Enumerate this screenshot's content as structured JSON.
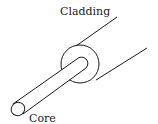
{
  "diagram": {
    "labels": {
      "cladding": "Cladding",
      "core": "Core"
    },
    "colors": {
      "stroke": "#1a1a1a",
      "text": "#222222",
      "background": "#ffffff"
    }
  }
}
